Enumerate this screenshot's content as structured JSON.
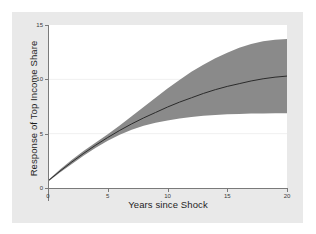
{
  "figure": {
    "background_color": "#ffffff",
    "card_color": "#e9e9e9",
    "plot_background_color": "#ffffff",
    "axis_color": "#7a7a7a",
    "band_color": "#8a8a8a",
    "line_color": "#2b2b2b",
    "gridline_color": "#f0f0f0"
  },
  "chart_data": {
    "type": "line",
    "title": "",
    "subtitle": "",
    "xlabel": "Years since Shock",
    "ylabel": "Response of Top Income Share",
    "xlim": [
      0,
      20
    ],
    "ylim": [
      0,
      15
    ],
    "xticks": [
      0,
      5,
      10,
      15,
      20
    ],
    "xtick_labels": [
      "0",
      "5",
      "10",
      "15",
      "20"
    ],
    "yticks": [
      0,
      5,
      10,
      15
    ],
    "ytick_labels": [
      "0",
      "5",
      "10",
      "15"
    ],
    "grid": "horizontal-faint",
    "legend": "none",
    "x": [
      0,
      1,
      2,
      3,
      4,
      5,
      6,
      7,
      8,
      9,
      10,
      11,
      12,
      13,
      14,
      15,
      16,
      17,
      18,
      19,
      20
    ],
    "series": [
      {
        "name": "Impulse response",
        "kind": "line",
        "values": [
          0.65,
          1.55,
          2.4,
          3.2,
          3.95,
          4.65,
          5.3,
          5.9,
          6.45,
          6.95,
          7.45,
          7.9,
          8.3,
          8.7,
          9.05,
          9.35,
          9.6,
          9.85,
          10.05,
          10.2,
          10.3
        ]
      },
      {
        "name": "Confidence band upper",
        "kind": "band-upper",
        "values": [
          0.72,
          1.7,
          2.6,
          3.42,
          4.18,
          4.95,
          5.75,
          6.6,
          7.45,
          8.3,
          9.15,
          9.95,
          10.7,
          11.35,
          11.95,
          12.45,
          12.9,
          13.25,
          13.5,
          13.65,
          13.72
        ]
      },
      {
        "name": "Confidence band lower",
        "kind": "band-lower",
        "values": [
          0.58,
          1.42,
          2.22,
          2.98,
          3.7,
          4.35,
          4.9,
          5.35,
          5.72,
          6.0,
          6.22,
          6.4,
          6.54,
          6.64,
          6.72,
          6.78,
          6.82,
          6.85,
          6.86,
          6.87,
          6.88
        ]
      }
    ]
  }
}
